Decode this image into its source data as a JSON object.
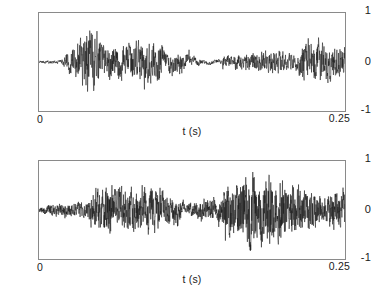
{
  "figure": {
    "background_color": "#ffffff",
    "trace_color": "#1b1b1b",
    "axis_color": "#8a8a8a",
    "panel_count": 2
  },
  "chart_data": [
    {
      "type": "line",
      "name": "top-waveform",
      "title": "",
      "subtitle": "",
      "xlabel": "t (s)",
      "ylabel": "",
      "xlim": [
        0,
        0.25
      ],
      "ylim": [
        -1,
        1
      ],
      "xticks": [
        0,
        0.25
      ],
      "xticklabels": [
        "0",
        "0.25"
      ],
      "yticks": [
        -1,
        0,
        1
      ],
      "yticklabels": [
        "-1",
        "0",
        "1"
      ],
      "grid": false,
      "legend": null,
      "sample_count": 1400,
      "seed": 20481,
      "description": "Broadband acoustic/vibration time series: near-silent onset, impulsive burst, decaying tonal oscillation, quiet noisy plateau, then renewed large oscillation.",
      "envelope_x": [
        0.0,
        0.018,
        0.03,
        0.04,
        0.05,
        0.062,
        0.072,
        0.085,
        0.1,
        0.112,
        0.12,
        0.128,
        0.14,
        0.155,
        0.17,
        0.185,
        0.2,
        0.208,
        0.216,
        0.228,
        0.24,
        0.25
      ],
      "envelope_y": [
        0.03,
        0.045,
        0.43,
        0.82,
        0.56,
        0.7,
        0.64,
        0.76,
        0.7,
        0.62,
        0.56,
        0.18,
        0.12,
        0.14,
        0.19,
        0.23,
        0.25,
        0.24,
        0.6,
        0.72,
        0.56,
        0.52
      ],
      "tone_freq_hz": [
        40,
        95,
        150,
        210,
        180,
        260
      ],
      "noise_fraction": [
        0.85,
        0.55,
        0.3,
        0.95,
        0.6
      ]
    },
    {
      "type": "line",
      "name": "bottom-waveform",
      "title": "",
      "subtitle": "",
      "xlabel": "t (s)",
      "ylabel": "",
      "xlim": [
        0,
        0.25
      ],
      "ylim": [
        -1,
        1
      ],
      "xticks": [
        0,
        0.25
      ],
      "xticklabels": [
        "0",
        "0.25"
      ],
      "yticks": [
        -1,
        0,
        1
      ],
      "yticklabels": [
        "-1",
        "0",
        "1"
      ],
      "grid": false,
      "legend": null,
      "sample_count": 1700,
      "seed": 77339,
      "description": "Broadband acoustic/vibration time series: low-level noise onset, sustained large oscillation, brief dip, dense high-amplitude noise swell, then sparser large oscillation at the end.",
      "envelope_x": [
        0.0,
        0.012,
        0.028,
        0.04,
        0.045,
        0.055,
        0.07,
        0.085,
        0.1,
        0.112,
        0.12,
        0.13,
        0.145,
        0.16,
        0.172,
        0.185,
        0.196,
        0.208,
        0.22,
        0.232,
        0.24,
        0.25
      ],
      "envelope_y": [
        0.06,
        0.17,
        0.2,
        0.23,
        0.56,
        0.82,
        0.68,
        0.7,
        0.66,
        0.62,
        0.2,
        0.42,
        0.52,
        0.6,
        0.82,
        0.76,
        0.7,
        0.64,
        0.56,
        0.3,
        0.56,
        0.48
      ],
      "tone_freq_hz": [
        55,
        120,
        190,
        250,
        300,
        360
      ],
      "noise_fraction": [
        0.7,
        0.6,
        0.45,
        0.88,
        0.75
      ]
    }
  ],
  "panels": [
    {
      "id": "top",
      "chart_index": 0,
      "axis": {
        "y_top_label": "1",
        "y_mid_label": "0",
        "y_bottom_label": "-1",
        "x_left_label": "0",
        "x_right_label": "0.25",
        "x_axis_title": "t (s)"
      }
    },
    {
      "id": "bottom",
      "chart_index": 1,
      "axis": {
        "y_top_label": "1",
        "y_mid_label": "0",
        "y_bottom_label": "-1",
        "x_left_label": "0",
        "x_right_label": "0.25",
        "x_axis_title": "t (s)"
      }
    }
  ]
}
